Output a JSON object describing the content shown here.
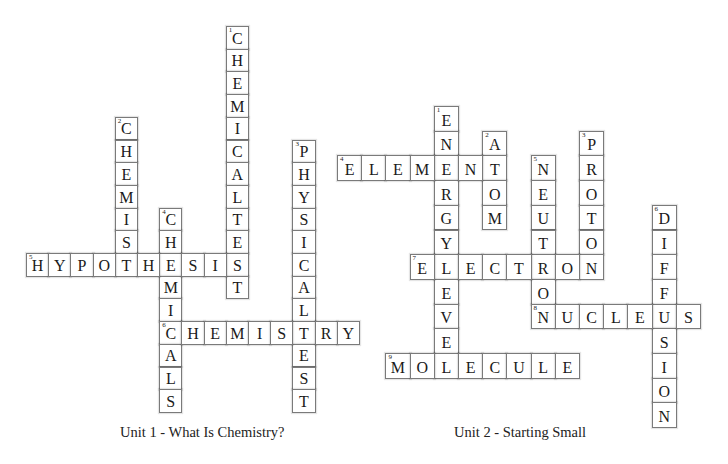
{
  "puzzles": [
    {
      "id": "unit1",
      "caption": "Unit 1 - What Is Chemistry?",
      "caption_pos": {
        "x": 120,
        "y": 424
      },
      "origin": {
        "x": 26,
        "y": 26
      },
      "cell": {
        "w": 22.2,
        "h": 22.7
      },
      "words": [
        {
          "number": "1",
          "dir": "down",
          "row": 0,
          "col": 9,
          "answer": "CHEMICALTEST"
        },
        {
          "number": "2",
          "dir": "down",
          "row": 4,
          "col": 4,
          "answer": "CHEMIST"
        },
        {
          "number": "3",
          "dir": "down",
          "row": 5,
          "col": 12,
          "answer": "PHYSICALTEST"
        },
        {
          "number": "4",
          "dir": "down",
          "row": 8,
          "col": 6,
          "answer": "CHEMICALS"
        },
        {
          "number": "5",
          "dir": "across",
          "row": 10,
          "col": 0,
          "answer": "HYPOTHESIS"
        },
        {
          "number": "6",
          "dir": "across",
          "row": 13,
          "col": 6,
          "answer": "CHEMISTRY"
        }
      ]
    },
    {
      "id": "unit2",
      "caption": "Unit 2 - Starting Small",
      "caption_pos": {
        "x": 454,
        "y": 424
      },
      "origin": {
        "x": 337,
        "y": 106
      },
      "cell": {
        "w": 24.2,
        "h": 24.7
      },
      "words": [
        {
          "number": "1",
          "dir": "down",
          "row": 0,
          "col": 4,
          "answer": "ENERGYLEVEL"
        },
        {
          "number": "2",
          "dir": "down",
          "row": 1,
          "col": 6,
          "answer": "ATOM"
        },
        {
          "number": "3",
          "dir": "down",
          "row": 1,
          "col": 10,
          "answer": "PROTON"
        },
        {
          "number": "4",
          "dir": "across",
          "row": 2,
          "col": 0,
          "answer": "ELEMENT"
        },
        {
          "number": "5",
          "dir": "down",
          "row": 2,
          "col": 8,
          "answer": "NEUTRON"
        },
        {
          "number": "6",
          "dir": "down",
          "row": 4,
          "col": 13,
          "answer": "DIFFUSION"
        },
        {
          "number": "7",
          "dir": "across",
          "row": 6,
          "col": 3,
          "answer": "ELECTRON"
        },
        {
          "number": "8",
          "dir": "across",
          "row": 8,
          "col": 8,
          "answer": "NUCLEUS"
        },
        {
          "number": "9",
          "dir": "across",
          "row": 10,
          "col": 2,
          "answer": "MOLECULE"
        }
      ]
    }
  ]
}
